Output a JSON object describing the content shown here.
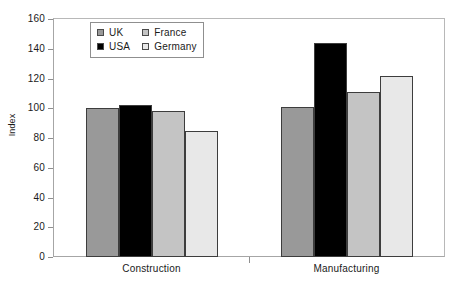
{
  "chart_data": {
    "type": "bar",
    "title": "",
    "xlabel": "",
    "ylabel": "Index",
    "ylim": [
      0,
      160
    ],
    "yticks": [
      0,
      20,
      40,
      60,
      80,
      100,
      120,
      140,
      160
    ],
    "grid": false,
    "legend_position": "top-center-inside",
    "categories": [
      "Construction",
      "Manufacturing"
    ],
    "series": [
      {
        "name": "UK",
        "color": "#999999",
        "values": [
          100,
          101
        ]
      },
      {
        "name": "USA",
        "color": "#000000",
        "values": [
          102,
          144
        ]
      },
      {
        "name": "France",
        "color": "#c4c4c4",
        "values": [
          98,
          111
        ]
      },
      {
        "name": "Germany",
        "color": "#e8e8e8",
        "values": [
          85,
          122
        ]
      }
    ]
  },
  "axis": {
    "y_title": "Index"
  }
}
